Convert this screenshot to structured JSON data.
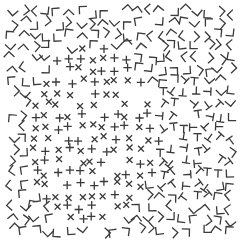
{
  "stimulus": {
    "type": "texture-segmentation",
    "width": 245,
    "height": 244,
    "background": "#ffffff",
    "glyph_color": "#3a3a3a",
    "glyph_size": 7,
    "stroke_width": 1.3,
    "grid_spacing": 11.5,
    "jitter": 3,
    "regions": [
      {
        "name": "cross-region",
        "glyph": "cross",
        "shape": "ellipse",
        "cx": 92,
        "cy": 135,
        "rx": 68,
        "ry": 88
      },
      {
        "name": "t-region",
        "glyph": "T",
        "shape": "ellipse",
        "cx": 188,
        "cy": 140,
        "rx": 44,
        "ry": 62
      },
      {
        "name": "background",
        "glyph": "L",
        "shape": "rest"
      }
    ]
  }
}
